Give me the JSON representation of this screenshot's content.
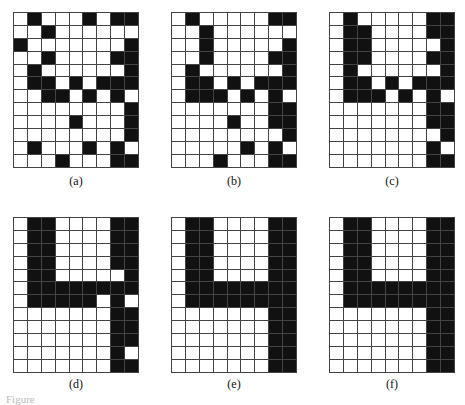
{
  "figure": {
    "rows": 12,
    "cols": 9,
    "panels": [
      {
        "label": "(a)",
        "cells": [
          [
            0,
            1,
            0,
            0,
            0,
            1,
            0,
            1,
            1
          ],
          [
            0,
            0,
            1,
            0,
            0,
            0,
            0,
            0,
            0
          ],
          [
            1,
            0,
            0,
            0,
            0,
            0,
            0,
            0,
            1
          ],
          [
            0,
            0,
            1,
            0,
            0,
            0,
            0,
            1,
            1
          ],
          [
            0,
            1,
            0,
            0,
            0,
            0,
            0,
            0,
            1
          ],
          [
            0,
            1,
            1,
            0,
            1,
            0,
            1,
            1,
            1
          ],
          [
            0,
            0,
            1,
            1,
            0,
            1,
            0,
            1,
            0
          ],
          [
            0,
            0,
            0,
            0,
            0,
            0,
            0,
            0,
            1
          ],
          [
            0,
            0,
            0,
            0,
            1,
            0,
            0,
            0,
            1
          ],
          [
            0,
            0,
            0,
            0,
            0,
            0,
            0,
            0,
            1
          ],
          [
            0,
            1,
            0,
            0,
            0,
            1,
            0,
            1,
            0
          ],
          [
            0,
            0,
            0,
            1,
            0,
            0,
            0,
            1,
            1
          ]
        ]
      },
      {
        "label": "(b)",
        "cells": [
          [
            0,
            1,
            0,
            0,
            0,
            0,
            0,
            1,
            1
          ],
          [
            0,
            0,
            1,
            0,
            0,
            0,
            0,
            0,
            0
          ],
          [
            0,
            0,
            1,
            0,
            0,
            0,
            0,
            0,
            1
          ],
          [
            0,
            0,
            1,
            0,
            0,
            0,
            0,
            1,
            1
          ],
          [
            0,
            1,
            0,
            0,
            0,
            0,
            0,
            0,
            1
          ],
          [
            0,
            1,
            1,
            0,
            1,
            0,
            1,
            1,
            1
          ],
          [
            0,
            1,
            1,
            1,
            0,
            1,
            0,
            1,
            0
          ],
          [
            0,
            0,
            0,
            0,
            0,
            0,
            0,
            1,
            1
          ],
          [
            0,
            0,
            0,
            0,
            1,
            0,
            0,
            1,
            1
          ],
          [
            0,
            0,
            0,
            0,
            0,
            0,
            0,
            0,
            1
          ],
          [
            0,
            0,
            0,
            0,
            0,
            1,
            0,
            1,
            0
          ],
          [
            0,
            0,
            0,
            1,
            0,
            0,
            0,
            1,
            1
          ]
        ]
      },
      {
        "label": "(c)",
        "cells": [
          [
            0,
            1,
            0,
            0,
            0,
            0,
            0,
            1,
            1
          ],
          [
            0,
            1,
            1,
            0,
            0,
            0,
            0,
            1,
            1
          ],
          [
            0,
            1,
            1,
            0,
            0,
            0,
            0,
            0,
            1
          ],
          [
            0,
            1,
            1,
            0,
            0,
            0,
            0,
            1,
            1
          ],
          [
            0,
            1,
            0,
            0,
            0,
            0,
            0,
            0,
            1
          ],
          [
            0,
            1,
            1,
            0,
            1,
            0,
            1,
            1,
            1
          ],
          [
            0,
            1,
            1,
            1,
            0,
            1,
            0,
            1,
            0
          ],
          [
            0,
            0,
            0,
            0,
            0,
            0,
            0,
            1,
            1
          ],
          [
            0,
            0,
            0,
            0,
            0,
            0,
            0,
            1,
            1
          ],
          [
            0,
            0,
            0,
            0,
            0,
            0,
            0,
            0,
            1
          ],
          [
            0,
            0,
            0,
            0,
            0,
            0,
            0,
            1,
            0
          ],
          [
            0,
            0,
            0,
            0,
            0,
            0,
            0,
            1,
            1
          ]
        ]
      },
      {
        "label": "(d)",
        "cells": [
          [
            0,
            1,
            1,
            0,
            0,
            0,
            0,
            1,
            1
          ],
          [
            0,
            1,
            1,
            0,
            0,
            0,
            0,
            1,
            1
          ],
          [
            0,
            1,
            1,
            0,
            0,
            0,
            0,
            1,
            1
          ],
          [
            0,
            1,
            1,
            0,
            0,
            0,
            0,
            1,
            1
          ],
          [
            0,
            1,
            1,
            0,
            0,
            0,
            0,
            0,
            1
          ],
          [
            0,
            1,
            1,
            1,
            1,
            1,
            1,
            1,
            1
          ],
          [
            0,
            1,
            1,
            1,
            1,
            1,
            0,
            1,
            0
          ],
          [
            0,
            0,
            0,
            0,
            0,
            0,
            0,
            1,
            1
          ],
          [
            0,
            0,
            0,
            0,
            0,
            0,
            0,
            1,
            1
          ],
          [
            0,
            0,
            0,
            0,
            0,
            0,
            0,
            1,
            1
          ],
          [
            0,
            0,
            0,
            0,
            0,
            0,
            0,
            1,
            0
          ],
          [
            0,
            0,
            0,
            0,
            0,
            0,
            0,
            1,
            1
          ]
        ]
      },
      {
        "label": "(e)",
        "cells": [
          [
            0,
            1,
            1,
            0,
            0,
            0,
            0,
            1,
            1
          ],
          [
            0,
            1,
            1,
            0,
            0,
            0,
            0,
            1,
            1
          ],
          [
            0,
            1,
            1,
            0,
            0,
            0,
            0,
            1,
            1
          ],
          [
            0,
            1,
            1,
            0,
            0,
            0,
            0,
            1,
            1
          ],
          [
            0,
            1,
            1,
            0,
            0,
            0,
            0,
            1,
            1
          ],
          [
            0,
            1,
            1,
            1,
            1,
            1,
            1,
            1,
            1
          ],
          [
            0,
            1,
            1,
            1,
            1,
            1,
            1,
            1,
            1
          ],
          [
            0,
            0,
            0,
            0,
            0,
            0,
            0,
            1,
            1
          ],
          [
            0,
            0,
            0,
            0,
            0,
            0,
            0,
            1,
            1
          ],
          [
            0,
            0,
            0,
            0,
            0,
            0,
            0,
            1,
            1
          ],
          [
            0,
            0,
            0,
            0,
            0,
            0,
            0,
            1,
            1
          ],
          [
            0,
            0,
            0,
            0,
            0,
            0,
            0,
            1,
            1
          ]
        ]
      },
      {
        "label": "(f)",
        "cells": [
          [
            0,
            1,
            1,
            0,
            0,
            0,
            0,
            1,
            1
          ],
          [
            0,
            1,
            1,
            0,
            0,
            0,
            0,
            1,
            1
          ],
          [
            0,
            1,
            1,
            0,
            0,
            0,
            0,
            1,
            1
          ],
          [
            0,
            1,
            1,
            0,
            0,
            0,
            0,
            1,
            1
          ],
          [
            0,
            1,
            1,
            0,
            0,
            0,
            0,
            1,
            1
          ],
          [
            0,
            1,
            1,
            1,
            1,
            1,
            1,
            1,
            1
          ],
          [
            0,
            1,
            1,
            1,
            1,
            1,
            1,
            1,
            1
          ],
          [
            0,
            0,
            0,
            0,
            0,
            0,
            0,
            1,
            1
          ],
          [
            0,
            0,
            0,
            0,
            0,
            0,
            0,
            1,
            1
          ],
          [
            0,
            0,
            0,
            0,
            0,
            0,
            0,
            1,
            1
          ],
          [
            0,
            0,
            0,
            0,
            0,
            0,
            0,
            1,
            1
          ],
          [
            0,
            0,
            0,
            0,
            0,
            0,
            0,
            1,
            1
          ]
        ]
      }
    ],
    "caption_partial": "Figure"
  }
}
